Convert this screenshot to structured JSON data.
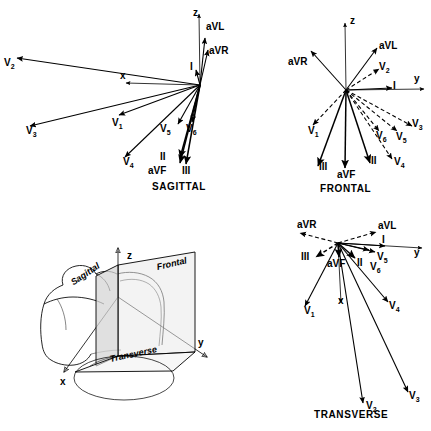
{
  "figure": {
    "ink_color": "#000000",
    "background": "#ffffff"
  },
  "panels": [
    {
      "id": "sagittal",
      "caption": "SAGITTAL",
      "origin": [
        200,
        85
      ],
      "axes": [
        {
          "name": "z",
          "label": "z",
          "tip": [
            199,
            14
          ]
        },
        {
          "name": "x",
          "label": "x",
          "tip": [
            126,
            83
          ]
        }
      ],
      "vectors": [
        {
          "label": "I",
          "sub": "",
          "tip": [
            196,
            70
          ],
          "style": "solid"
        },
        {
          "label": "aVL",
          "sub": "",
          "tip": [
            205,
            38
          ],
          "style": "solid"
        },
        {
          "label": "aVR",
          "sub": "",
          "tip": [
            208,
            50
          ],
          "style": "solid"
        },
        {
          "label": "V",
          "sub": "2",
          "tip": [
            17,
            58
          ],
          "style": "solid"
        },
        {
          "label": "V",
          "sub": "3",
          "tip": [
            30,
            126
          ],
          "style": "solid"
        },
        {
          "label": "V",
          "sub": "1",
          "tip": [
            119,
            115
          ],
          "style": "solid"
        },
        {
          "label": "V",
          "sub": "4",
          "tip": [
            125,
            157
          ],
          "style": "solid"
        },
        {
          "label": "V",
          "sub": "5",
          "tip": [
            178,
            124
          ],
          "style": "solid"
        },
        {
          "label": "V",
          "sub": "6",
          "tip": [
            192,
            122
          ],
          "style": "solid"
        },
        {
          "label": "II",
          "sub": "",
          "tip": [
            180,
            158
          ],
          "style": "solid"
        },
        {
          "label": "III",
          "sub": "",
          "tip": [
            186,
            164
          ],
          "style": "solid"
        },
        {
          "label": "aVF",
          "sub": "",
          "tip": [
            180,
            163
          ],
          "style": "solid"
        }
      ],
      "labels": [
        {
          "text": "z",
          "sub": "",
          "x": 193,
          "y": 8,
          "cls": "axis"
        },
        {
          "text": "x",
          "sub": "",
          "x": 120,
          "y": 71,
          "cls": "axis"
        },
        {
          "text": "I",
          "sub": "",
          "x": 190,
          "y": 62,
          "cls": "vec"
        },
        {
          "text": "aVL",
          "sub": "",
          "x": 206,
          "y": 22,
          "cls": "vec"
        },
        {
          "text": "aVR",
          "sub": "",
          "x": 209,
          "y": 46,
          "cls": "vec"
        },
        {
          "text": "V",
          "sub": "2",
          "x": 4,
          "y": 58,
          "cls": "vec"
        },
        {
          "text": "V",
          "sub": "3",
          "x": 26,
          "y": 126,
          "cls": "vec"
        },
        {
          "text": "V",
          "sub": "1",
          "x": 112,
          "y": 118,
          "cls": "vec"
        },
        {
          "text": "V",
          "sub": "4",
          "x": 123,
          "y": 157,
          "cls": "vec"
        },
        {
          "text": "V",
          "sub": "5",
          "x": 160,
          "y": 124,
          "cls": "vec"
        },
        {
          "text": "V",
          "sub": "6",
          "x": 186,
          "y": 124,
          "cls": "vec"
        },
        {
          "text": "II",
          "sub": "",
          "x": 160,
          "y": 152,
          "cls": "vec"
        },
        {
          "text": "III",
          "sub": "",
          "x": 182,
          "y": 166,
          "cls": "vec"
        },
        {
          "text": "aVF",
          "sub": "",
          "x": 148,
          "y": 166,
          "cls": "vec"
        }
      ],
      "caption_pos": [
        152,
        182
      ]
    },
    {
      "id": "frontal",
      "caption": "FRONTAL",
      "origin": [
        346,
        90
      ],
      "axes": [
        {
          "name": "z",
          "label": "z",
          "tip": [
            345,
            23
          ]
        },
        {
          "name": "y",
          "label": "y",
          "tip": [
            424,
            89
          ]
        }
      ],
      "vectors": [
        {
          "label": "I",
          "sub": "",
          "tip": [
            392,
            88
          ],
          "style": "solid"
        },
        {
          "label": "aVL",
          "sub": "",
          "tip": [
            377,
            48
          ],
          "style": "solid"
        },
        {
          "label": "aVR",
          "sub": "",
          "tip": [
            311,
            51
          ],
          "style": "solid"
        },
        {
          "label": "V",
          "sub": "2",
          "tip": [
            379,
            69
          ],
          "style": "dashed"
        },
        {
          "label": "V",
          "sub": "1",
          "tip": [
            313,
            125
          ],
          "style": "dashed"
        },
        {
          "label": "V",
          "sub": "3",
          "tip": [
            412,
            126
          ],
          "style": "dashed"
        },
        {
          "label": "V",
          "sub": "5",
          "tip": [
            397,
            131
          ],
          "style": "dashed"
        },
        {
          "label": "V",
          "sub": "6",
          "tip": [
            379,
            131
          ],
          "style": "dashed"
        },
        {
          "label": "V",
          "sub": "4",
          "tip": [
            392,
            159
          ],
          "style": "dashed"
        },
        {
          "label": "II",
          "sub": "",
          "tip": [
            370,
            163
          ],
          "style": "solid"
        },
        {
          "label": "III",
          "sub": "",
          "tip": [
            318,
            166
          ],
          "style": "solid"
        },
        {
          "label": "aVF",
          "sub": "",
          "tip": [
            345,
            168
          ],
          "style": "solid"
        }
      ],
      "labels": [
        {
          "text": "z",
          "sub": "",
          "x": 350,
          "y": 16,
          "cls": "axis"
        },
        {
          "text": "y",
          "sub": "",
          "x": 414,
          "y": 74,
          "cls": "axis"
        },
        {
          "text": "I",
          "sub": "",
          "x": 393,
          "y": 81,
          "cls": "vec"
        },
        {
          "text": "aVL",
          "sub": "",
          "x": 379,
          "y": 41,
          "cls": "vec"
        },
        {
          "text": "aVR",
          "sub": "",
          "x": 288,
          "y": 57,
          "cls": "vec"
        },
        {
          "text": "V",
          "sub": "2",
          "x": 379,
          "y": 62,
          "cls": "vec"
        },
        {
          "text": "V",
          "sub": "1",
          "x": 308,
          "y": 126,
          "cls": "vec"
        },
        {
          "text": "V",
          "sub": "3",
          "x": 412,
          "y": 119,
          "cls": "vec"
        },
        {
          "text": "V",
          "sub": "5",
          "x": 396,
          "y": 132,
          "cls": "vec"
        },
        {
          "text": "V",
          "sub": "6",
          "x": 376,
          "y": 131,
          "cls": "vec"
        },
        {
          "text": "V",
          "sub": "4",
          "x": 394,
          "y": 157,
          "cls": "vec"
        },
        {
          "text": "II",
          "sub": "",
          "x": 371,
          "y": 156,
          "cls": "vec"
        },
        {
          "text": "III",
          "sub": "",
          "x": 319,
          "y": 162,
          "cls": "vec"
        },
        {
          "text": "aVF",
          "sub": "",
          "x": 337,
          "y": 170,
          "cls": "vec"
        }
      ],
      "caption_pos": [
        320,
        184
      ]
    },
    {
      "id": "transverse",
      "caption": "TRANSVERSE",
      "origin": [
        338,
        243
      ],
      "axes": [
        {
          "name": "y",
          "label": "y",
          "tip": [
            422,
            248
          ]
        },
        {
          "name": "x",
          "label": "x",
          "tip": [
            341,
            303
          ]
        }
      ],
      "vectors": [
        {
          "label": "I",
          "sub": "",
          "tip": [
            385,
            246
          ],
          "style": "solid"
        },
        {
          "label": "aVL",
          "sub": "",
          "tip": [
            376,
            232
          ],
          "style": "dashed"
        },
        {
          "label": "aVR",
          "sub": "",
          "tip": [
            300,
            233
          ],
          "style": "dashed"
        },
        {
          "label": "III",
          "sub": "",
          "tip": [
            316,
            257
          ],
          "style": "dashed"
        },
        {
          "label": "II",
          "sub": "",
          "tip": [
            355,
            258
          ],
          "style": "solid"
        },
        {
          "label": "aVF",
          "sub": "",
          "tip": [
            339,
            257
          ],
          "style": "solid"
        },
        {
          "label": "V",
          "sub": "5",
          "tip": [
            375,
            252
          ],
          "style": "solid"
        },
        {
          "label": "V",
          "sub": "6",
          "tip": [
            369,
            250
          ],
          "style": "solid"
        },
        {
          "label": "V",
          "sub": "1",
          "tip": [
            305,
            306
          ],
          "style": "solid"
        },
        {
          "label": "V",
          "sub": "4",
          "tip": [
            388,
            302
          ],
          "style": "solid"
        },
        {
          "label": "V",
          "sub": "2",
          "tip": [
            363,
            403
          ],
          "style": "solid"
        },
        {
          "label": "V",
          "sub": "3",
          "tip": [
            408,
            392
          ],
          "style": "solid"
        }
      ],
      "labels": [
        {
          "text": "y",
          "sub": "",
          "x": 414,
          "y": 248,
          "cls": "axis"
        },
        {
          "text": "x",
          "sub": "",
          "x": 338,
          "y": 296,
          "cls": "axis"
        },
        {
          "text": "I",
          "sub": "",
          "x": 382,
          "y": 235,
          "cls": "vec"
        },
        {
          "text": "aVL",
          "sub": "",
          "x": 378,
          "y": 221,
          "cls": "vec"
        },
        {
          "text": "aVR",
          "sub": "",
          "x": 297,
          "y": 220,
          "cls": "vec"
        },
        {
          "text": "III",
          "sub": "",
          "x": 301,
          "y": 252,
          "cls": "vec"
        },
        {
          "text": "II",
          "sub": "",
          "x": 357,
          "y": 258,
          "cls": "vec"
        },
        {
          "text": "aVF",
          "sub": "",
          "x": 327,
          "y": 259,
          "cls": "vec"
        },
        {
          "text": "V",
          "sub": "5",
          "x": 377,
          "y": 252,
          "cls": "vec"
        },
        {
          "text": "V",
          "sub": "6",
          "x": 370,
          "y": 262,
          "cls": "vec"
        },
        {
          "text": "V",
          "sub": "1",
          "x": 304,
          "y": 306,
          "cls": "vec"
        },
        {
          "text": "V",
          "sub": "4",
          "x": 389,
          "y": 301,
          "cls": "vec"
        },
        {
          "text": "V",
          "sub": "2",
          "x": 366,
          "y": 401,
          "cls": "vec"
        },
        {
          "text": "V",
          "sub": "3",
          "x": 409,
          "y": 391,
          "cls": "vec"
        }
      ],
      "caption_pos": [
        314,
        410
      ]
    },
    {
      "id": "torso",
      "caption": "",
      "origin": [
        118,
        297
      ],
      "axes": [
        {
          "name": "z",
          "label": "z",
          "tip": [
            118,
            248
          ]
        },
        {
          "name": "y",
          "label": "y",
          "tip": [
            207,
            357
          ]
        },
        {
          "name": "x",
          "label": "x",
          "tip": [
            64,
            372
          ]
        }
      ],
      "vectors": [],
      "labels": [
        {
          "text": "z",
          "sub": "",
          "x": 127,
          "y": 251,
          "cls": "axis"
        },
        {
          "text": "y",
          "sub": "",
          "x": 198,
          "y": 338,
          "cls": "axis"
        },
        {
          "text": "x",
          "sub": "",
          "x": 60,
          "y": 377,
          "cls": "axis"
        }
      ],
      "plane_labels": [
        {
          "text": "Sagittal",
          "x": 72,
          "y": 279,
          "rotate": -34
        },
        {
          "text": "Frontal",
          "x": 157,
          "y": 263,
          "rotate": -13
        },
        {
          "text": "Transverse",
          "x": 110,
          "y": 355,
          "rotate": -12
        }
      ],
      "caption_pos": [
        0,
        0
      ]
    }
  ]
}
